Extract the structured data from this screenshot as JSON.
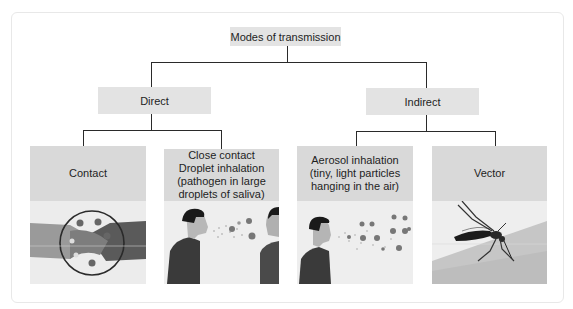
{
  "diagram": {
    "root": {
      "label": "Modes of transmission"
    },
    "branches": [
      {
        "label": "Direct",
        "children": [
          {
            "label_lines": [
              "Contact"
            ],
            "illustration": "handshake-icon"
          },
          {
            "label_lines": [
              "Close contact",
              "Droplet inhalation",
              "(pathogen in large",
              "droplets of saliva)"
            ],
            "illustration": "two-people-droplets-icon"
          }
        ]
      },
      {
        "label": "Indirect",
        "children": [
          {
            "label_lines": [
              "Aerosol inhalation",
              "(tiny, light particles",
              "hanging in the air)"
            ],
            "illustration": "person-aerosol-icon"
          },
          {
            "label_lines": [
              "Vector"
            ],
            "illustration": "mosquito-icon"
          }
        ]
      }
    ]
  },
  "colors": {
    "node_bg": "#e3e3e3",
    "card_header_bg": "#d9d9d9",
    "connector": "#2a2a2a",
    "pathogen": "#7a7a7a"
  }
}
